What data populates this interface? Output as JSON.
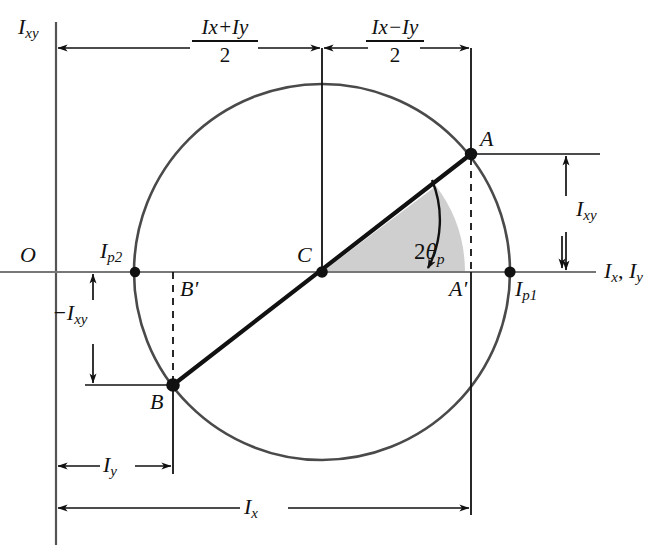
{
  "figure": {
    "type": "mohrs-circle-moments-of-inertia",
    "background_color": "#ffffff",
    "ink_color": "#111111",
    "axis_color": "#555555",
    "circle_color": "#4a4a4a",
    "sector_fill": "#cfcfcf",
    "axes": {
      "vertical_label": "I",
      "vertical_sub": "xy",
      "horizontal_label": "I",
      "horizontal_sub_x": "x",
      "horizontal_sub_y": "y",
      "horizontal_label_full": "Ix, Iy",
      "origin_label": "O"
    },
    "points": [
      {
        "name": "A",
        "label": "A",
        "x": 471,
        "y": 154,
        "kind": "circle-point"
      },
      {
        "name": "B",
        "label": "B",
        "x": 173,
        "y": 385,
        "kind": "circle-point"
      },
      {
        "name": "C",
        "label": "C",
        "x": 322,
        "y": 272,
        "kind": "center"
      },
      {
        "name": "Ip1",
        "label": "I",
        "sub": "p1",
        "x": 510,
        "y": 272,
        "kind": "principal"
      },
      {
        "name": "Ip2",
        "label": "I",
        "sub": "p2",
        "x": 135,
        "y": 272,
        "kind": "principal"
      },
      {
        "name": "Ap",
        "label": "A'",
        "x": 471,
        "y": 272,
        "kind": "foot"
      },
      {
        "name": "Bp",
        "label": "B'",
        "x": 173,
        "y": 272,
        "kind": "foot"
      }
    ],
    "circle": {
      "cx": 322,
      "cy": 272,
      "r": 188
    },
    "angle": {
      "label": "2",
      "theta": "θ",
      "sub": "p",
      "label_full": "2θp",
      "value_deg": 37,
      "sector_fill": "#cfcfcf"
    },
    "dimensions": [
      {
        "name": "mean-moment",
        "kind": "fraction",
        "numerator": "Ix + Iy",
        "num_parts": [
          "I",
          "x",
          "+",
          "I",
          "y"
        ],
        "denominator": "2",
        "from_x": 56,
        "to_x": 322,
        "y": 48
      },
      {
        "name": "half-difference",
        "kind": "fraction",
        "numerator": "Ix - Iy",
        "num_parts": [
          "I",
          "x",
          "−",
          "I",
          "y"
        ],
        "denominator": "2",
        "from_x": 322,
        "to_x": 471,
        "y": 48
      },
      {
        "name": "product-of-inertia-positive",
        "kind": "simple",
        "label": "I",
        "sub": "xy",
        "from_y": 154,
        "to_y": 272,
        "x": 566,
        "orientation": "vertical"
      },
      {
        "name": "product-of-inertia-negative",
        "kind": "simple",
        "label": "−I",
        "sub": "xy",
        "from_y": 272,
        "to_y": 385,
        "x": 93,
        "orientation": "vertical"
      },
      {
        "name": "moment-of-inertia-y",
        "kind": "simple",
        "label": "I",
        "sub": "y",
        "from_x": 56,
        "to_x": 173,
        "y": 466,
        "orientation": "horizontal"
      },
      {
        "name": "moment-of-inertia-x",
        "kind": "simple",
        "label": "I",
        "sub": "x",
        "from_x": 56,
        "to_x": 471,
        "y": 508,
        "orientation": "horizontal"
      }
    ]
  }
}
